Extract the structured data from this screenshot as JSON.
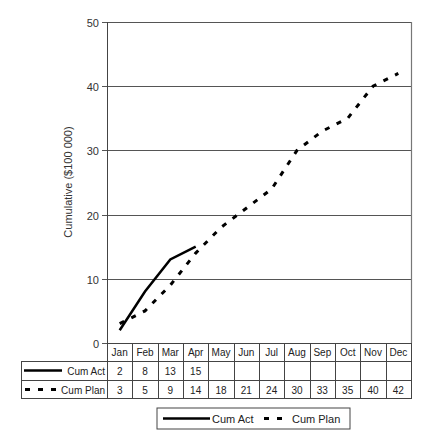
{
  "chart_data": {
    "type": "line",
    "title": "",
    "xlabel": "",
    "ylabel": "Cumulative ($100 000)",
    "ylim": [
      0,
      50
    ],
    "yticks": [
      0,
      10,
      20,
      30,
      40,
      50
    ],
    "grid": true,
    "categories": [
      "Jan",
      "Feb",
      "Mar",
      "Apr",
      "May",
      "Jun",
      "Jul",
      "Aug",
      "Sep",
      "Oct",
      "Nov",
      "Dec"
    ],
    "series": [
      {
        "name": "Cum Act",
        "style": "solid",
        "color": "#000000",
        "values": [
          2,
          8,
          13,
          15,
          null,
          null,
          null,
          null,
          null,
          null,
          null,
          null
        ]
      },
      {
        "name": "Cum Plan",
        "style": "dashed",
        "color": "#000000",
        "values": [
          3,
          5,
          9,
          14,
          18,
          21,
          24,
          30,
          33,
          35,
          40,
          42
        ]
      }
    ],
    "data_table": true,
    "legend_position": "bottom"
  },
  "legend": {
    "items": [
      {
        "label": "Cum Act",
        "style": "solid"
      },
      {
        "label": "Cum Plan",
        "style": "dashed"
      }
    ]
  }
}
